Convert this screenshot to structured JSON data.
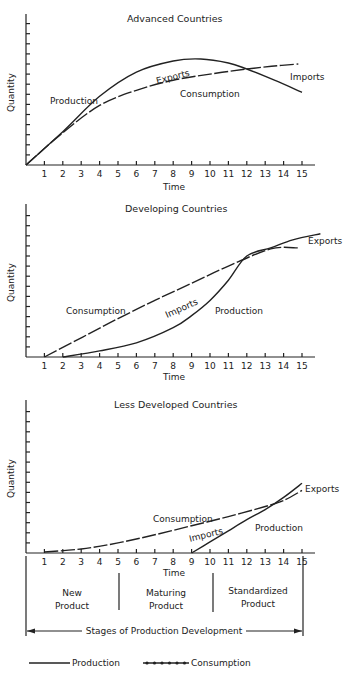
{
  "chart_data": [
    {
      "type": "line",
      "title": "Advanced Countries",
      "xlabel": "Time",
      "ylabel": "Quantity",
      "x_ticks": [
        1,
        2,
        3,
        4,
        5,
        6,
        7,
        8,
        9,
        10,
        11,
        12,
        13,
        14,
        15
      ],
      "xlim": [
        0,
        16
      ],
      "ylim": [
        0,
        15
      ],
      "grid": false,
      "series": [
        {
          "name": "Production",
          "style": "solid",
          "x": [
            0,
            2,
            4,
            6,
            8,
            9.5,
            11,
            12,
            13.5,
            15
          ],
          "y": [
            0,
            3.3,
            6.8,
            9.2,
            10.3,
            10.5,
            10.1,
            9.5,
            8.4,
            7.2
          ]
        },
        {
          "name": "Consumption",
          "style": "dotted-marker",
          "x": [
            0,
            2,
            4,
            6,
            8,
            10,
            12,
            13.5,
            14.8
          ],
          "y": [
            0,
            3.2,
            5.9,
            7.4,
            8.4,
            9.0,
            9.5,
            9.8,
            10.0
          ]
        }
      ],
      "annotations": [
        "Production",
        "Exports",
        "Consumption",
        "Imports"
      ]
    },
    {
      "type": "line",
      "title": "Developing Countries",
      "xlabel": "Time",
      "ylabel": "Quantity",
      "x_ticks": [
        1,
        2,
        3,
        4,
        5,
        6,
        7,
        8,
        9,
        10,
        11,
        12,
        13,
        14,
        15
      ],
      "xlim": [
        0,
        16
      ],
      "ylim": [
        0,
        15
      ],
      "grid": false,
      "series": [
        {
          "name": "Production",
          "style": "solid",
          "x": [
            2,
            4,
            6,
            8,
            9,
            10,
            11,
            12,
            13.3,
            14.5,
            16
          ],
          "y": [
            0,
            0.6,
            1.4,
            2.9,
            4.1,
            5.6,
            7.6,
            10.0,
            10.8,
            11.6,
            12.2
          ]
        },
        {
          "name": "Consumption",
          "style": "dotted-marker",
          "x": [
            1,
            3,
            5,
            7,
            9,
            11,
            13.3,
            14.8
          ],
          "y": [
            0,
            1.9,
            3.8,
            5.6,
            7.3,
            9.0,
            10.7,
            10.8
          ]
        }
      ],
      "annotations": [
        "Consumption",
        "Imports",
        "Production",
        "Exports"
      ]
    },
    {
      "type": "line",
      "title": "Less Developed Countries",
      "xlabel": "Time",
      "ylabel": "Quantity",
      "x_ticks": [
        1,
        2,
        3,
        4,
        5,
        6,
        7,
        8,
        9,
        10,
        11,
        12,
        13,
        14,
        15
      ],
      "xlim": [
        0,
        16
      ],
      "ylim": [
        0,
        15
      ],
      "grid": false,
      "series": [
        {
          "name": "Production",
          "style": "solid",
          "x": [
            9,
            10,
            11,
            12,
            13,
            14,
            15
          ],
          "y": [
            0,
            1.1,
            2.2,
            3.3,
            4.3,
            5.5,
            6.9
          ]
        },
        {
          "name": "Consumption",
          "style": "dotted-marker",
          "x": [
            1,
            3,
            5,
            7,
            9,
            11,
            13,
            14,
            15
          ],
          "y": [
            0.1,
            0.4,
            1.0,
            1.8,
            2.7,
            3.6,
            4.6,
            5.2,
            6.2
          ]
        }
      ],
      "annotations": [
        "Consumption",
        "Imports",
        "Production",
        "Exports"
      ]
    }
  ],
  "stages": {
    "items": [
      {
        "label_line1": "New",
        "label_line2": "Product",
        "from": 0,
        "to": 5
      },
      {
        "label_line1": "Maturing",
        "label_line2": "Product",
        "from": 5,
        "to": 10
      },
      {
        "label_line1": "Standardized",
        "label_line2": "Product",
        "from": 10,
        "to": 15
      }
    ],
    "caption": "Stages of Production Development"
  },
  "legend": {
    "production": "Production",
    "consumption": "Consumption"
  },
  "labels": {
    "c1": {
      "title": "Advanced Countries",
      "production": "Production",
      "exports": "Exports",
      "consumption": "Consumption",
      "imports": "Imports",
      "xlabel": "Time",
      "ylabel": "Quantity"
    },
    "c2": {
      "title": "Developing Countries",
      "consumption": "Consumption",
      "imports": "Imports",
      "production": "Production",
      "exports": "Exports",
      "xlabel": "Time",
      "ylabel": "Quantity"
    },
    "c3": {
      "title": "Less Developed Countries",
      "consumption": "Consumption",
      "imports": "Imports",
      "production": "Production",
      "exports": "Exports",
      "xlabel": "Time",
      "ylabel": "Quantity"
    }
  }
}
